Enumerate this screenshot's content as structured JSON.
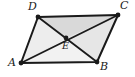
{
  "figure": {
    "type": "geometry-diagram",
    "shape": "parallelogram",
    "background_color": "#ffffff",
    "fill_color": "#d9d9d9",
    "fill_color_light": "#ebebeb",
    "stroke_color": "#1a1a1a",
    "vertex_dot_color": "#1a1a1a",
    "stroke_width": 2,
    "vertices": [
      {
        "name": "A",
        "label": "A",
        "x": 21,
        "y": 63,
        "label_x": 9,
        "label_y": 60
      },
      {
        "name": "B",
        "label": "B",
        "x": 97,
        "y": 62,
        "label_x": 99,
        "label_y": 63
      },
      {
        "name": "C",
        "label": "C",
        "x": 118,
        "y": 15,
        "label_x": 120,
        "label_y": 2
      },
      {
        "name": "D",
        "label": "D",
        "x": 38,
        "y": 17,
        "label_x": 28,
        "label_y": 2
      },
      {
        "name": "E",
        "label": "E",
        "x": 66,
        "y": 38,
        "label_x": 63,
        "label_y": 42
      }
    ],
    "sides": [
      {
        "name": "AB",
        "from": "A",
        "to": "B"
      },
      {
        "name": "BC",
        "from": "B",
        "to": "C"
      },
      {
        "name": "CD",
        "from": "C",
        "to": "D"
      },
      {
        "name": "DA",
        "from": "D",
        "to": "A"
      }
    ],
    "diagonals": [
      {
        "name": "AC",
        "from": "A",
        "to": "C"
      },
      {
        "name": "BD",
        "from": "B",
        "to": "D"
      }
    ],
    "intersection": {
      "name": "E",
      "label": "E"
    },
    "polygon_points": "21,63 97,62 118,15 38,17",
    "triangle_ADE_points": "21,63 38,17 66,38",
    "triangle_DCE_points": "38,17 118,15 66,38",
    "triangle_CBE_points": "118,15 97,62 66,38",
    "triangle_ABE_points": "21,63 97,62 66,38"
  }
}
